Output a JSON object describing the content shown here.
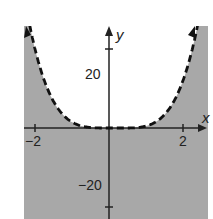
{
  "chart_data": {
    "type": "line",
    "title": "",
    "xlabel": "x",
    "ylabel": "y",
    "xlim": [
      -2.3,
      2.65
    ],
    "ylim": [
      -23,
      25
    ],
    "x_ticks": [
      -2,
      2
    ],
    "x_tick_labels": [
      "−2",
      "2"
    ],
    "y_ticks": [
      -20,
      20
    ],
    "y_tick_labels": [
      "−20",
      "20"
    ],
    "grid": false,
    "series": [
      {
        "name": "boundary curve (dashed)",
        "style": "dashed",
        "function": "y ≈ x^4 − 0.5x^3",
        "x": [
          -2.2,
          -1.84,
          -1.27,
          -0.5,
          0,
          0.5,
          1.0,
          1.54,
          1.95,
          2.27
        ],
        "y": [
          23,
          14.7,
          4.5,
          0.1,
          0,
          0,
          0.5,
          3.8,
          10.7,
          20.7
        ]
      }
    ],
    "shading": {
      "region": "below curve (y < f(x))",
      "color": "#a8a8a8"
    },
    "colors": {
      "shade": "#a8a8a8",
      "curve": "#111111",
      "axes": "#222222"
    }
  }
}
